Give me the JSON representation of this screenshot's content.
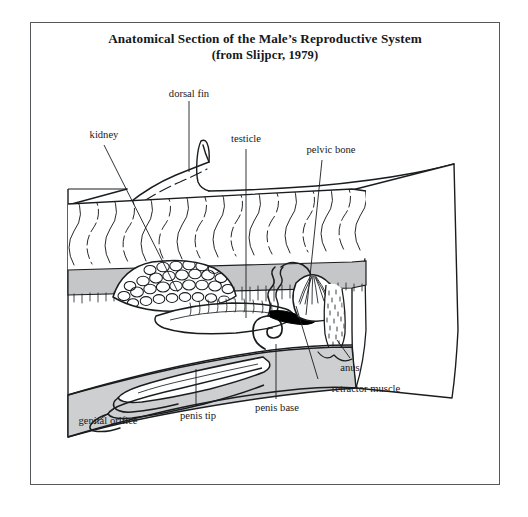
{
  "figure": {
    "title_line1": "Anatomical Section of the Male’s Reproductive System",
    "title_line2": "(from Slijpcr, 1979)",
    "caption_source": "Slijpcr, 1979",
    "kind": "anatomical-sagittal-section"
  },
  "labels": {
    "dorsal_fin": "dorsal fin",
    "kidney": "kidney",
    "testicle": "testicle",
    "pelvic_bone": "pelvic bone",
    "anus": "anus",
    "retractor_muscle": "retractor muscle",
    "penis_base": "penis base",
    "penis_tip": "penis tip",
    "genital_orifice": "genital orifice"
  },
  "colors": {
    "frame_border": "#55595c",
    "ink": "#17191b",
    "line": "#1a1d1f",
    "gray_band": "#c4c6c7",
    "gray_band_dark": "#b4b7b9",
    "ventral_band": "#cdcfd0",
    "paper": "#ffffff",
    "pelvic_bone_fill": "#000000"
  },
  "structures": [
    {
      "name": "dorsal-fin",
      "label": "dorsal fin"
    },
    {
      "name": "muscle-layer",
      "label": ""
    },
    {
      "name": "vertebral-band",
      "label": ""
    },
    {
      "name": "kidney",
      "label": "kidney"
    },
    {
      "name": "testicle",
      "label": "testicle"
    },
    {
      "name": "pelvic-bone",
      "label": "pelvic bone"
    },
    {
      "name": "retractor-muscle",
      "label": "retractor muscle"
    },
    {
      "name": "anal-canal",
      "label": "anus"
    },
    {
      "name": "penis-coil",
      "label": "penis base"
    },
    {
      "name": "penis-shaft",
      "label": "penis tip"
    },
    {
      "name": "genital-orifice",
      "label": "genital orifice"
    }
  ]
}
